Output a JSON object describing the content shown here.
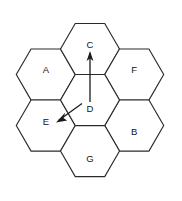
{
  "diagram": {
    "geometry": {
      "width": 182,
      "height": 201,
      "hex_radius": 29.5,
      "stroke_color": "#2b2b2b",
      "fill_color": "#ffffff",
      "label_color": "#141414",
      "arrow_color": "#1c1c1c"
    },
    "cells": [
      {
        "id": "center",
        "label": "D",
        "cx": 90.0,
        "cy": 100.0,
        "label_x": 90.0,
        "label_y": 108.0
      },
      {
        "id": "top",
        "label": "C",
        "cx": 90.0,
        "cy": 49.0,
        "label_x": 90.0,
        "label_y": 44.0
      },
      {
        "id": "upper-right",
        "label": "F",
        "cx": 134.2,
        "cy": 74.5,
        "label_x": 134.2,
        "label_y": 69.0
      },
      {
        "id": "lower-right",
        "label": "B",
        "cx": 134.2,
        "cy": 125.5,
        "label_x": 134.2,
        "label_y": 131.0
      },
      {
        "id": "bottom",
        "label": "G",
        "cx": 90.0,
        "cy": 151.0,
        "label_x": 90.0,
        "label_y": 158.0
      },
      {
        "id": "lower-left",
        "label": "E",
        "cx": 45.8,
        "cy": 125.5,
        "label_x": 45.8,
        "label_y": 121.0
      },
      {
        "id": "upper-left",
        "label": "A",
        "cx": 45.8,
        "cy": 74.5,
        "label_x": 45.8,
        "label_y": 69.0
      }
    ],
    "arrows": [
      {
        "id": "arrow-d-to-c",
        "from_cell": "D",
        "to_cell": "C",
        "x1": 90.0,
        "y1": 102.0,
        "x2": 90.0,
        "y2": 53.0,
        "head_points": "90,51.0 86.6,61.0 90,58.6 93.4,61.0"
      },
      {
        "id": "arrow-d-to-e",
        "from_cell": "D",
        "to_cell": "E",
        "x1": 82.0,
        "y1": 103.5,
        "x2": 58.5,
        "y2": 120.5,
        "head_points": "56.0,122.4 67.2,120.6 63.4,118.0 65.3,112.6"
      }
    ]
  }
}
